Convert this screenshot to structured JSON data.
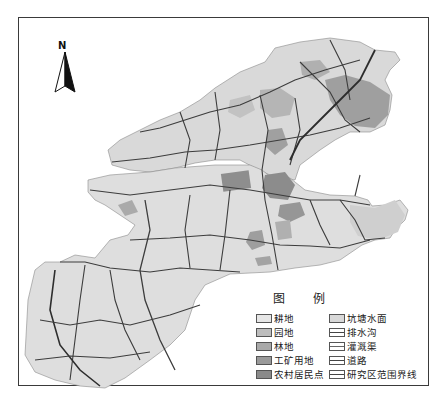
{
  "map": {
    "north_arrow_label": "N",
    "legend_title": "图 例",
    "legend": {
      "left": [
        {
          "label": "耕地",
          "icon": "cropland-swatch",
          "color": "#e6e6e6"
        },
        {
          "label": "园地",
          "icon": "orchard-swatch",
          "color": "#bdbdbd"
        },
        {
          "label": "林地",
          "icon": "forest-swatch",
          "color": "#a9a9a9"
        },
        {
          "label": "工矿用地",
          "icon": "industrial-land-swatch",
          "color": "#9a9a9a"
        },
        {
          "label": "农村居民点",
          "icon": "rural-settlement-swatch",
          "color": "#8a8a8a"
        }
      ],
      "right": [
        {
          "label": "坑塘水面",
          "icon": "pond-water-swatch",
          "color": "#d8d8d8"
        },
        {
          "label": "排水沟",
          "icon": "drainage-ditch-line",
          "color": "#444444"
        },
        {
          "label": "灌溉渠",
          "icon": "irrigation-canal-line",
          "color": "#777777"
        },
        {
          "label": "道路",
          "icon": "road-line",
          "color": "#444444"
        },
        {
          "label": "研究区范围界线",
          "icon": "study-area-boundary-line",
          "color": "#555555"
        }
      ]
    },
    "colors": {
      "cropland": "#dcdcdc",
      "forest": "#a8a8a8",
      "settlement": "#8c8c8c",
      "roads": "#3c3c3c",
      "frame": "#3a3a3a"
    }
  }
}
